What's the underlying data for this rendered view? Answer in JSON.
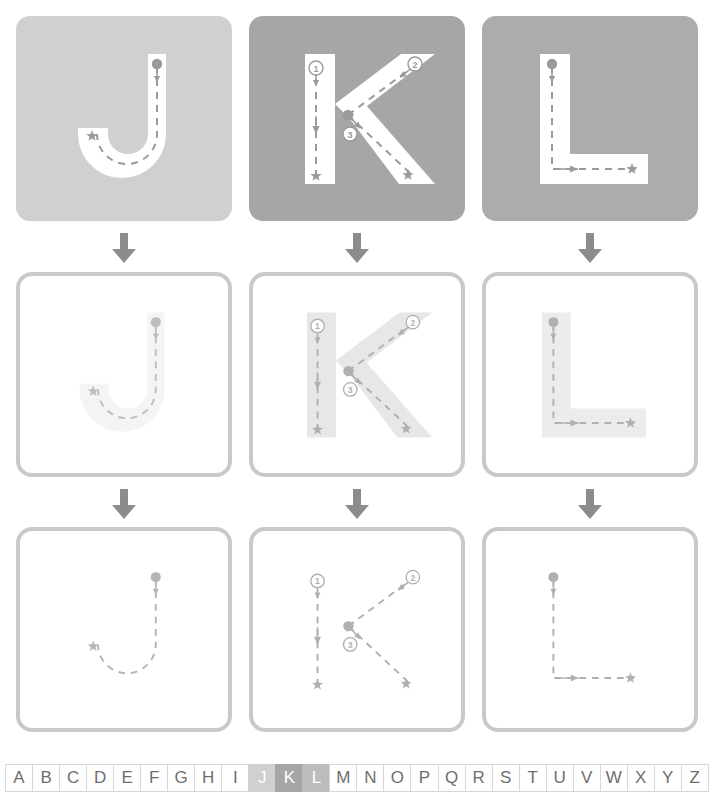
{
  "worksheet": {
    "title": "Letter tracing practice sheet",
    "letters": [
      "J",
      "K",
      "L"
    ],
    "rows": [
      {
        "id": "row-demo",
        "label": "Solid letter with stroke guides"
      },
      {
        "id": "row-trace",
        "label": "Faint letter to trace"
      },
      {
        "id": "row-freehand",
        "label": "Dashed guide only"
      }
    ]
  },
  "colors": {
    "tile_j": "#d0d0d0",
    "tile_k": "#a6a6a6",
    "tile_l": "#acacac",
    "letter_fill_solid": "#ffffff",
    "letter_fill_faint": "#ececec",
    "guide": "#9a9a9a",
    "guide_light": "#c2c2c2",
    "tile_border": "#c9c9c9",
    "arrow": "#8c8c8c",
    "alpha_text": "#6e6e6e",
    "alpha_border": "#d8d8d8"
  },
  "tiles": [
    {
      "name": "tile-j-demo",
      "letter": "J",
      "row": 0,
      "col": 0,
      "style": "solid",
      "bg": "#d0d0d0",
      "letter_fill": "#ffffff",
      "guide": "#9a9a9a",
      "strokes": 1
    },
    {
      "name": "tile-k-demo",
      "letter": "K",
      "row": 0,
      "col": 1,
      "style": "solid",
      "bg": "#a6a6a6",
      "letter_fill": "#ffffff",
      "guide": "#9a9a9a",
      "strokes": 3
    },
    {
      "name": "tile-l-demo",
      "letter": "L",
      "row": 0,
      "col": 2,
      "style": "solid",
      "bg": "#acacac",
      "letter_fill": "#ffffff",
      "guide": "#9a9a9a",
      "strokes": 1
    },
    {
      "name": "tile-j-trace",
      "letter": "J",
      "row": 1,
      "col": 0,
      "style": "outline",
      "bg": "#ffffff",
      "letter_fill": "#f4f4f4",
      "guide": "#bdbdbd",
      "strokes": 1
    },
    {
      "name": "tile-k-trace",
      "letter": "K",
      "row": 1,
      "col": 1,
      "style": "outline",
      "bg": "#ffffff",
      "letter_fill": "#e7e7e7",
      "guide": "#b0b0b0",
      "strokes": 3
    },
    {
      "name": "tile-l-trace",
      "letter": "L",
      "row": 1,
      "col": 2,
      "style": "outline",
      "bg": "#ffffff",
      "letter_fill": "#ececec",
      "guide": "#b0b0b0",
      "strokes": 1
    },
    {
      "name": "tile-j-freehand",
      "letter": "J",
      "row": 2,
      "col": 0,
      "style": "outline",
      "bg": "#ffffff",
      "letter_fill": "none",
      "guide": "#b5b5b5",
      "strokes": 1
    },
    {
      "name": "tile-k-freehand",
      "letter": "K",
      "row": 2,
      "col": 1,
      "style": "outline",
      "bg": "#ffffff",
      "letter_fill": "none",
      "guide": "#b0b0b0",
      "strokes": 3
    },
    {
      "name": "tile-l-freehand",
      "letter": "L",
      "row": 2,
      "col": 2,
      "style": "outline",
      "bg": "#ffffff",
      "letter_fill": "none",
      "guide": "#b0b0b0",
      "strokes": 1
    }
  ],
  "stroke_numbers": {
    "k": [
      "1",
      "2",
      "3"
    ]
  },
  "arrows": [
    {
      "name": "arrow-col-j-row1",
      "col": 0,
      "gap": 0,
      "direction": "down"
    },
    {
      "name": "arrow-col-k-row1",
      "col": 1,
      "gap": 0,
      "direction": "down"
    },
    {
      "name": "arrow-col-l-row1",
      "col": 2,
      "gap": 0,
      "direction": "down"
    },
    {
      "name": "arrow-col-j-row2",
      "col": 0,
      "gap": 1,
      "direction": "down"
    },
    {
      "name": "arrow-col-k-row2",
      "col": 1,
      "gap": 1,
      "direction": "down"
    },
    {
      "name": "arrow-col-l-row2",
      "col": 2,
      "gap": 1,
      "direction": "down"
    }
  ],
  "alphabet": {
    "letters": [
      "A",
      "B",
      "C",
      "D",
      "E",
      "F",
      "G",
      "H",
      "I",
      "J",
      "K",
      "L",
      "M",
      "N",
      "O",
      "P",
      "Q",
      "R",
      "S",
      "T",
      "U",
      "V",
      "W",
      "X",
      "Y",
      "Z"
    ],
    "highlighted": [
      "J",
      "K",
      "L"
    ],
    "highlight_colors": {
      "J": "#d0d0d0",
      "K": "#a6a6a6",
      "L": "#bcbcbc"
    }
  }
}
